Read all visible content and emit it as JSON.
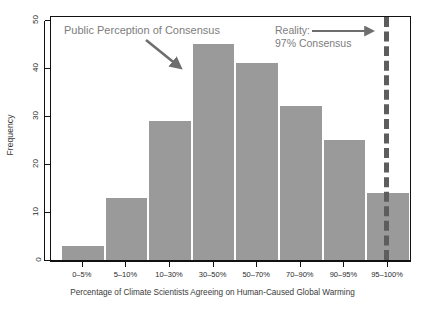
{
  "chart_data": {
    "type": "bar",
    "title": "",
    "xlabel": "Percentage of Climate Scientists Agreeing on Human-Caused Global Warming",
    "ylabel": "Frequency",
    "categories": [
      "0–5%",
      "5–10%",
      "10–30%",
      "30–50%",
      "50–70%",
      "70–90%",
      "90–95%",
      "95–100%"
    ],
    "values": [
      3,
      13,
      29,
      45,
      41,
      32,
      25,
      14
    ],
    "ylim": [
      0,
      50
    ],
    "yticks": [
      0,
      10,
      20,
      30,
      40,
      50
    ],
    "ytick_labels": [
      "0",
      "10",
      "20",
      "30",
      "40",
      "50"
    ],
    "grid": false,
    "legend": false,
    "bar_color": "#9a9a9a",
    "annotations": [
      {
        "id": "public-perception",
        "text": "Public Perception of Consensus",
        "color": "#7d7d7d",
        "arrow": "diagonal-down-right",
        "points_to_category": "30–50%"
      },
      {
        "id": "reality",
        "line1": "Reality:",
        "line2": "97% Consensus",
        "color": "#7d7d7d",
        "arrow": "horizontal-right",
        "points_to": "reality-dashed-line"
      }
    ],
    "reference_line": {
      "id": "reality-dashed-line",
      "label": "97% Consensus",
      "value": 97,
      "style": "dashed",
      "color": "#5d5d5d"
    }
  },
  "axis": {
    "y_title": "Frequency",
    "x_title": "Percentage of Climate Scientists Agreeing on Human-Caused Global Warming"
  },
  "colors": {
    "bar": "#9a9a9a",
    "annotation": "#7d7d7d",
    "reference_line": "#5d5d5d",
    "axis": "#111111",
    "background": "#ffffff"
  }
}
